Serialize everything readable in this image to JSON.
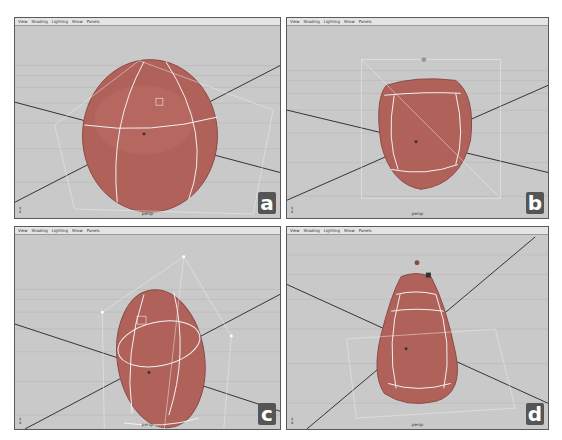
{
  "menu": [
    "View",
    "Shading",
    "Lighting",
    "Show",
    "Panels"
  ],
  "panels": [
    {
      "id": "a",
      "label": "a",
      "camera": "persp",
      "shape": "sphere"
    },
    {
      "id": "b",
      "label": "b",
      "camera": "persp",
      "shape": "squashed-sphere"
    },
    {
      "id": "c",
      "label": "c",
      "camera": "persp",
      "shape": "tilted-egg"
    },
    {
      "id": "d",
      "label": "d",
      "camera": "persp",
      "shape": "pear"
    }
  ],
  "axis_indicator": {
    "y": "y",
    "x": "x"
  },
  "colors": {
    "background": "#c9c9c9",
    "object": "#b0625a",
    "object_edge": "#8a4a44",
    "wire": "#f2f2f2",
    "axis_line": "#333333",
    "grid": "#b4b4b4"
  }
}
